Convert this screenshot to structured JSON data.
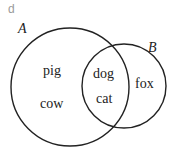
{
  "panel_label": "d",
  "sets": [
    {
      "name": "A",
      "only": [
        "pig",
        "cow"
      ]
    },
    {
      "name": "B",
      "only": [
        "fox"
      ]
    }
  ],
  "intersection": [
    "dog",
    "cat"
  ],
  "colors": {
    "stroke": "#222222",
    "text": "#222222",
    "panel": "#9a9a9a"
  }
}
